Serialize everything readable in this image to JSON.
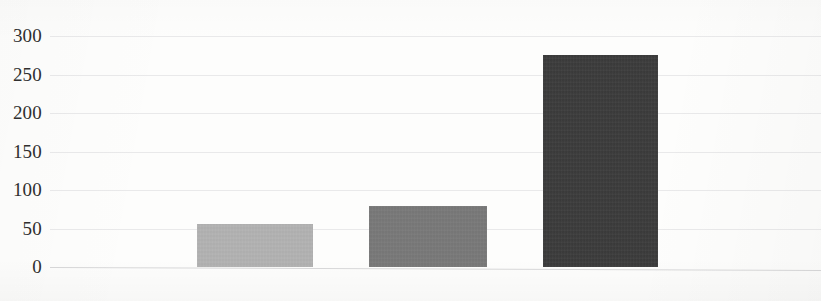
{
  "chart_data": {
    "type": "bar",
    "title": "",
    "subtitle": "",
    "xlabel": "",
    "ylabel": "",
    "categories": [
      "",
      "",
      ""
    ],
    "values": [
      56,
      79,
      275
    ],
    "series": [
      {
        "name": "",
        "values": [
          56,
          79,
          275
        ],
        "colors": [
          "#b2b2b2",
          "#787878",
          "#3b3b3b"
        ]
      }
    ],
    "ylim": [
      0,
      300
    ],
    "ytick_labels": [
      "300",
      "250",
      "200",
      "150",
      "100",
      "50",
      "0"
    ],
    "ytick_values": [
      300,
      250,
      200,
      150,
      100,
      50,
      0
    ],
    "ytick_step": 50,
    "xtick_labels": [],
    "grid": true,
    "grid_axis": "y",
    "grid_color": "#e9e9ea",
    "axis_color": "#d8d8d9",
    "legend": false,
    "legend_position": "none",
    "background_color": "#fdfdfc",
    "label_color": "#2f2f2f",
    "annotations": []
  },
  "bars": [
    {
      "name": "bar-1",
      "value": 56,
      "color": "#b2b2b2",
      "left_px": 197,
      "width_px": 116
    },
    {
      "name": "bar-2",
      "value": 79,
      "color": "#787878",
      "left_px": 369,
      "width_px": 118
    },
    {
      "name": "bar-3",
      "value": 275,
      "color": "#3b3b3b",
      "left_px": 543,
      "width_px": 115
    }
  ],
  "axis": {
    "baseline_value": 0,
    "baseline_y_px": 267,
    "px_per_unit": 0.77
  }
}
